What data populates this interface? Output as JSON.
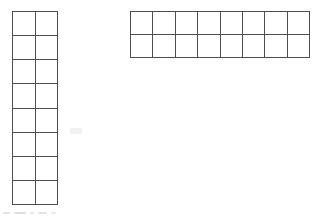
{
  "page": {
    "background_color": "#ffffff",
    "width_px": 323,
    "height_px": 217
  },
  "style": {
    "grid_line_color": "#4e4e4e",
    "cell_fill_color": "#ffffff",
    "grid_line_width_px": 1.6,
    "artifact_color": "#d8d8d8"
  },
  "figures": [
    {
      "name": "vertical-grid",
      "orientation": "vertical",
      "columns": 2,
      "rows": 8,
      "total_cells": 16,
      "filled_cells": 0,
      "label": "",
      "position": {
        "left_px": 12,
        "top_px": 11,
        "width_px": 46,
        "height_px": 194
      },
      "cell_size_px": {
        "width": 23,
        "height": 24.25
      }
    },
    {
      "name": "horizontal-grid",
      "orientation": "horizontal",
      "columns": 8,
      "rows": 2,
      "total_cells": 16,
      "filled_cells": 0,
      "label": "",
      "position": {
        "left_px": 130,
        "top_px": 11,
        "width_px": 180,
        "height_px": 47
      },
      "cell_size_px": {
        "width": 22.5,
        "height": 23.5
      }
    }
  ],
  "artifacts": {
    "bottom_scan_marks": 5,
    "description": ""
  }
}
